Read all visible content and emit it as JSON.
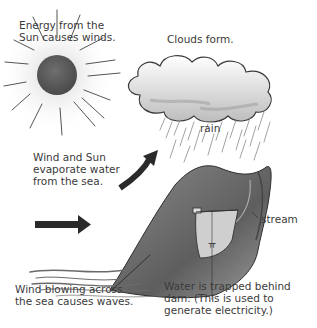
{
  "diagram": {
    "labels": {
      "sun_energy": [
        "Energy from the",
        "Sun causes winds."
      ],
      "clouds": "Clouds form.",
      "rain": "rain",
      "evaporate": [
        "Wind and Sun",
        "evaporate water",
        "from the sea."
      ],
      "stream": "stream",
      "waves": [
        "Wind blowing across",
        "the sea causes waves."
      ],
      "dam": [
        "Water is trapped behind",
        "dam. (This is used to",
        "generate electricity.)"
      ]
    },
    "icons": {
      "sun": "sun-icon",
      "cloud": "cloud-icon",
      "rain": "rain-streaks",
      "curved_arrow": "curved-arrow-icon",
      "straight_arrow": "right-arrow-icon",
      "mountain": "mountain-illustration",
      "sea": "sea-waves-illustration",
      "dam": "dam-illustration"
    },
    "colors": {
      "sun_fill": "#5a5a5a",
      "arrow": "#2a2a2a",
      "cloud_outline": "#3a3a3a",
      "mountain": "#7a7a7a",
      "lake": "#c8c8c8",
      "text": "#3b3b3b"
    }
  }
}
